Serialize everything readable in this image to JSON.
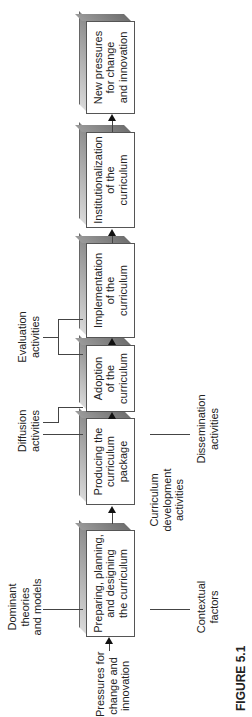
{
  "figure_label": "FIGURE 5.1",
  "input_label": [
    "Pressures for",
    "change and",
    "innovation"
  ],
  "stages": [
    {
      "id": "preparing",
      "lines": [
        "Preparing, planning,",
        "and designing",
        "the curriculum"
      ]
    },
    {
      "id": "producing",
      "lines": [
        "Producing the",
        "curriculum",
        "package"
      ]
    },
    {
      "id": "adoption",
      "lines": [
        "Adoption",
        "of the",
        "curriculum"
      ]
    },
    {
      "id": "implementation",
      "lines": [
        "Implementation",
        "of the",
        "curriculum"
      ]
    },
    {
      "id": "institutionalization",
      "lines": [
        "Institutionalization",
        "of the",
        "curriculum"
      ]
    },
    {
      "id": "new-pressures",
      "lines": [
        "New pressures",
        "for change",
        "and innovation"
      ]
    }
  ],
  "annotations": {
    "dominant_theories": [
      "Dominant",
      "theories",
      "and models"
    ],
    "contextual_factors": [
      "Contextual",
      "factors"
    ],
    "curriculum_development": [
      "Curriculum",
      "development",
      "activities"
    ],
    "diffusion": [
      "Diffusion",
      "activities"
    ],
    "dissemination": [
      "Dissemination",
      "activities"
    ],
    "evaluation": [
      "Evaluation",
      "activities"
    ]
  }
}
